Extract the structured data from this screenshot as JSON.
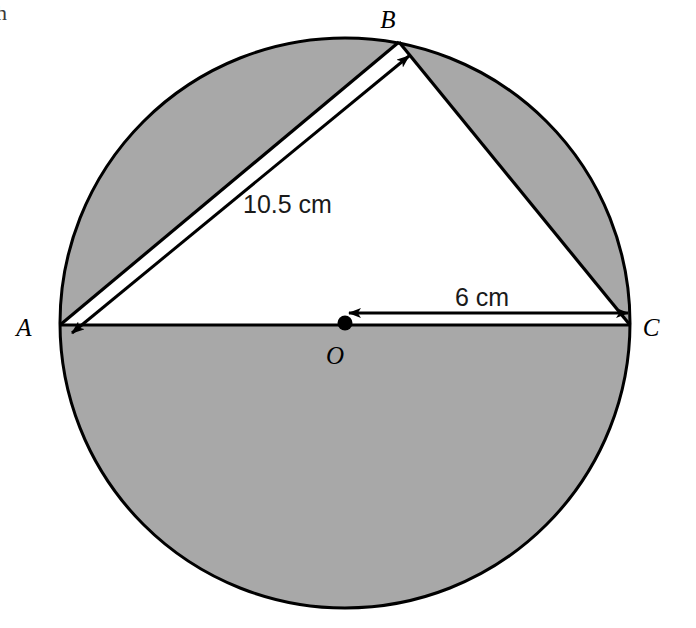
{
  "figure": {
    "background_color": "#ffffff",
    "shade_color": "#a8a8a8",
    "stroke_color": "#000000",
    "corner_fragment": "h"
  },
  "circle": {
    "center_label": "O",
    "cx": 345,
    "cy": 323,
    "r": 285,
    "stroke_width": 3
  },
  "points": [
    {
      "name": "A",
      "label": "A",
      "x": 60,
      "y": 325,
      "label_x": 24,
      "label_y": 336
    },
    {
      "name": "B",
      "label": "B",
      "x": 399,
      "y": 42,
      "label_x": 388,
      "label_y": 28
    },
    {
      "name": "C",
      "label": "C",
      "x": 630,
      "y": 325,
      "label_x": 651,
      "label_y": 336
    },
    {
      "name": "O",
      "label": "O",
      "x": 345,
      "y": 323,
      "label_x": 335,
      "label_y": 364
    }
  ],
  "segments": [
    {
      "name": "diameter-AC",
      "from": "A",
      "to": "C"
    },
    {
      "name": "chord-AB",
      "from": "A",
      "to": "B"
    },
    {
      "name": "chord-BC",
      "from": "B",
      "to": "C"
    }
  ],
  "dimensions": [
    {
      "name": "AB",
      "label": "10.5 cm",
      "label_x": 243,
      "label_y": 213,
      "x1": 72,
      "y1": 333,
      "x2": 409,
      "y2": 56,
      "arrow_both_ends": true
    },
    {
      "name": "OC",
      "label": "6 cm",
      "label_x": 455,
      "label_y": 306,
      "x1": 349,
      "y1": 313,
      "x2": 628,
      "y2": 313,
      "arrow_both_ends": true
    }
  ],
  "shaded_regions": [
    "lower-semicircle",
    "upper-left-segment-AB",
    "upper-right-segment-BC"
  ],
  "chart_data": {
    "type": "diagram",
    "measurements": [
      {
        "segment": "AB",
        "value": 10.5,
        "unit": "cm",
        "display": "10.5 cm"
      },
      {
        "segment": "OC",
        "value": 6,
        "unit": "cm",
        "display": "6 cm"
      }
    ],
    "labels": [
      "A",
      "B",
      "C",
      "O",
      "10.5 cm",
      "6 cm"
    ]
  }
}
